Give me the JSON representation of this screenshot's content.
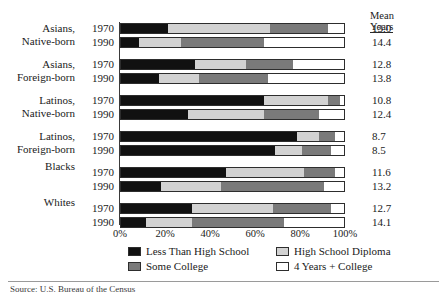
{
  "mean_header": {
    "line1": "Mean",
    "line2": "Years"
  },
  "axis": {
    "ticks": [
      "0%",
      "20%",
      "40%",
      "60%",
      "80%",
      "100%"
    ],
    "tick_values": [
      0,
      20,
      40,
      60,
      80,
      100
    ]
  },
  "legend": {
    "items": [
      {
        "label": "Less Than High School",
        "color": "#111111",
        "key": "s1"
      },
      {
        "label": "High School Diploma",
        "color": "#d2d2d2",
        "key": "s2"
      },
      {
        "label": "Some College",
        "color": "#7a7a7a",
        "key": "s3"
      },
      {
        "label": "4 Years + College",
        "color": "#ffffff",
        "key": "s4"
      }
    ]
  },
  "source": "Source: U.S. Bureau of the Census",
  "chart_data": {
    "type": "bar",
    "orientation": "horizontal",
    "stacked": true,
    "normalized_percent": true,
    "title": "",
    "xlabel": "",
    "ylabel": "",
    "xlim": [
      0,
      100
    ],
    "grid": false,
    "legend_position": "bottom",
    "series": [
      {
        "name": "Less Than High School",
        "color": "#111111"
      },
      {
        "name": "High School Diploma",
        "color": "#d2d2d2"
      },
      {
        "name": "Some College",
        "color": "#7a7a7a"
      },
      {
        "name": "4 Years + College",
        "color": "#ffffff"
      }
    ],
    "groups": [
      {
        "label_line1": "Asians,",
        "label_line2": "Native-born",
        "rows": [
          {
            "year": "1970",
            "values": [
              21,
              46,
              26,
              7
            ],
            "mean_years": "13.0"
          },
          {
            "year": "1990",
            "values": [
              8,
              19,
              37,
              36
            ],
            "mean_years": "14.4"
          }
        ]
      },
      {
        "label_line1": "Asians,",
        "label_line2": "Foreign-born",
        "rows": [
          {
            "year": "1970",
            "values": [
              33,
              23,
              21,
              23
            ],
            "mean_years": "12.8"
          },
          {
            "year": "1990",
            "values": [
              17,
              18,
              31,
              34
            ],
            "mean_years": "13.8"
          }
        ]
      },
      {
        "label_line1": "Latinos,",
        "label_line2": "Native-born",
        "rows": [
          {
            "year": "1970",
            "values": [
              64,
              29,
              5,
              2
            ],
            "mean_years": "10.8"
          },
          {
            "year": "1990",
            "values": [
              30,
              34,
              25,
              11
            ],
            "mean_years": "12.4"
          }
        ]
      },
      {
        "label_line1": "Latinos,",
        "label_line2": "Foreign-born",
        "rows": [
          {
            "year": "1970",
            "values": [
              79,
              10,
              7,
              4
            ],
            "mean_years": "8.7"
          },
          {
            "year": "1990",
            "values": [
              69,
              12,
              13,
              6
            ],
            "mean_years": "8.5"
          }
        ]
      },
      {
        "label_line1": "Blacks",
        "label_line2": "",
        "rows": [
          {
            "year": "1970",
            "values": [
              47,
              35,
              14,
              4
            ],
            "mean_years": "11.6"
          },
          {
            "year": "1990",
            "values": [
              18,
              27,
              46,
              9
            ],
            "mean_years": "13.2"
          }
        ]
      },
      {
        "label_line1": "Whites",
        "label_line2": "",
        "rows": [
          {
            "year": "1970",
            "values": [
              32,
              36,
              26,
              6
            ],
            "mean_years": "12.7"
          },
          {
            "year": "1990",
            "values": [
              11,
              21,
              41,
              27
            ],
            "mean_years": "14.1"
          }
        ]
      }
    ]
  }
}
